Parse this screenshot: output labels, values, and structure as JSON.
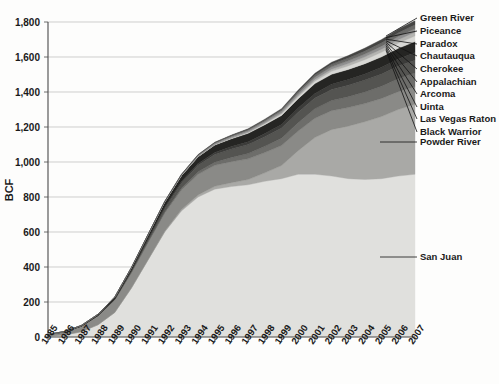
{
  "chart": {
    "type": "area",
    "ylabel": "BCF",
    "xlabel": "",
    "title": ""
  },
  "chart_data": {
    "type": "area",
    "stacked": true,
    "title": "",
    "subtitle": "",
    "xlabel": "",
    "ylabel": "BCF",
    "xlim": [
      1985,
      2007
    ],
    "ylim": [
      0,
      1800
    ],
    "ytick_step": 200,
    "grid": true,
    "legend_position": "right-callout",
    "x": [
      1985,
      1986,
      1987,
      1988,
      1989,
      1990,
      1991,
      1992,
      1993,
      1994,
      1995,
      1996,
      1997,
      1998,
      1999,
      2000,
      2001,
      2002,
      2003,
      2004,
      2005,
      2006,
      2007
    ],
    "xticklabels": [
      "1985",
      "1986",
      "1987",
      "1988",
      "1989",
      "1990",
      "1991",
      "1992",
      "1993",
      "1994",
      "1995",
      "1996",
      "1997",
      "1998",
      "1999",
      "2000",
      "2001",
      "2002",
      "2003",
      "2004",
      "2005",
      "2006",
      "2007"
    ],
    "yticklabels": [
      "0",
      "200",
      "400",
      "600",
      "800",
      "1,000",
      "1,200",
      "1,400",
      "1,600",
      "1,800"
    ],
    "yticks": [
      0,
      200,
      400,
      600,
      800,
      1000,
      1200,
      1400,
      1600,
      1800
    ],
    "series": [
      {
        "name": "San Juan",
        "color": "#e0e0dd",
        "values": [
          5,
          12,
          30,
          70,
          140,
          280,
          440,
          600,
          720,
          800,
          845,
          860,
          870,
          890,
          905,
          930,
          930,
          920,
          905,
          900,
          905,
          920,
          930
        ]
      },
      {
        "name": "Powder River",
        "color": "#a9a9a6",
        "values": [
          0,
          0,
          0,
          0,
          0,
          0,
          2,
          4,
          8,
          12,
          16,
          22,
          30,
          48,
          75,
          135,
          210,
          265,
          300,
          330,
          355,
          380,
          400
        ]
      },
      {
        "name": "Black Warrior",
        "color": "#8a8a87",
        "values": [
          8,
          18,
          32,
          52,
          72,
          88,
          98,
          105,
          112,
          118,
          120,
          120,
          118,
          116,
          114,
          112,
          110,
          108,
          106,
          104,
          103,
          102,
          100
        ]
      },
      {
        "name": "Las Vegas Raton",
        "color": "#6d6d6a",
        "values": [
          0,
          0,
          0,
          0,
          1,
          2,
          4,
          6,
          10,
          14,
          18,
          24,
          30,
          36,
          42,
          48,
          54,
          58,
          62,
          66,
          70,
          74,
          78
        ]
      },
      {
        "name": "Uinta",
        "color": "#545451",
        "values": [
          0,
          0,
          0,
          1,
          3,
          8,
          14,
          22,
          30,
          38,
          44,
          48,
          52,
          55,
          58,
          60,
          62,
          64,
          66,
          68,
          70,
          72,
          74
        ]
      },
      {
        "name": "Arcoma",
        "color": "#3c3c3a",
        "values": [
          0,
          0,
          0,
          0,
          1,
          2,
          4,
          6,
          8,
          10,
          12,
          14,
          16,
          18,
          20,
          23,
          26,
          29,
          32,
          35,
          38,
          41,
          44
        ]
      },
      {
        "name": "Appalachian",
        "color": "#252523",
        "values": [
          1,
          2,
          4,
          7,
          11,
          16,
          22,
          28,
          34,
          38,
          42,
          45,
          48,
          50,
          52,
          54,
          56,
          57,
          58,
          59,
          60,
          61,
          62
        ]
      },
      {
        "name": "Cherokee",
        "color": "#d8d8d5",
        "values": [
          0,
          0,
          0,
          0,
          0,
          0,
          0,
          0,
          1,
          1,
          2,
          3,
          4,
          6,
          8,
          11,
          14,
          17,
          20,
          23,
          26,
          29,
          32
        ]
      },
      {
        "name": "Chautauqua",
        "color": "#b4b4b1",
        "values": [
          0,
          0,
          0,
          0,
          0,
          0,
          0,
          0,
          0,
          1,
          1,
          2,
          3,
          4,
          6,
          8,
          10,
          12,
          14,
          16,
          18,
          20,
          22
        ]
      },
      {
        "name": "Paradox",
        "color": "#909090",
        "values": [
          0,
          0,
          0,
          0,
          0,
          1,
          2,
          3,
          4,
          6,
          7,
          8,
          9,
          10,
          11,
          12,
          13,
          14,
          15,
          16,
          17,
          18,
          19
        ]
      },
      {
        "name": "Piceance",
        "color": "#6a6a68",
        "values": [
          0,
          0,
          0,
          0,
          0,
          0,
          1,
          1,
          2,
          3,
          4,
          5,
          6,
          7,
          8,
          10,
          12,
          14,
          16,
          18,
          20,
          22,
          24
        ]
      },
      {
        "name": "Green River",
        "color": "#454543",
        "values": [
          0,
          0,
          0,
          0,
          0,
          0,
          0,
          1,
          1,
          2,
          2,
          3,
          4,
          5,
          6,
          8,
          10,
          12,
          14,
          16,
          18,
          20,
          22
        ]
      }
    ]
  },
  "legend": {
    "callouts": [
      {
        "label": "Green River",
        "y": 18
      },
      {
        "label": "Piceance",
        "y": 31
      },
      {
        "label": "Paradox",
        "y": 44
      },
      {
        "label": "Chautauqua",
        "y": 56
      },
      {
        "label": "Cherokee",
        "y": 69
      },
      {
        "label": "Appalachian",
        "y": 82
      },
      {
        "label": "Arcoma",
        "y": 94
      },
      {
        "label": "Uinta",
        "y": 107
      },
      {
        "label": "Las Vegas Raton",
        "y": 119
      },
      {
        "label": "Black Warrior",
        "y": 132
      },
      {
        "label": "Powder River",
        "y": 142
      },
      {
        "label": "San Juan",
        "y": 257
      }
    ]
  },
  "colors": {
    "grid": "#b9b9b9",
    "axis": "#4a4a4a",
    "text": "#1a1a1a",
    "background": "#fdfdfc"
  }
}
